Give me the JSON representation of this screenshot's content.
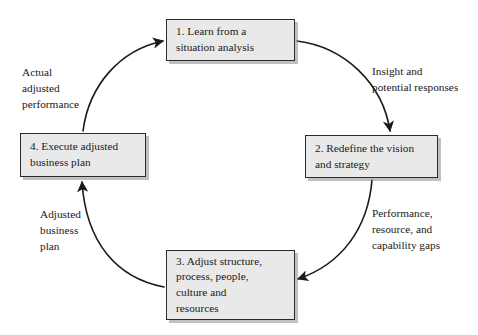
{
  "diagram": {
    "type": "cycle-flowchart",
    "title": "",
    "background_color": "#ffffff",
    "box_fill_color": "#e9e9e9",
    "box_border_color": "#2b2b2b",
    "arrow_color": "#1a1a1a",
    "nodes": [
      {
        "id": "node-1",
        "label": "1. Learn from a\nsituation analysis"
      },
      {
        "id": "node-2",
        "label": "2. Redefine the vision\nand strategy"
      },
      {
        "id": "node-3",
        "label": "3. Adjust structure,\nprocess, people,\nculture and\nresources"
      },
      {
        "id": "node-4",
        "label": "4. Execute adjusted\nbusiness plan"
      }
    ],
    "edge_labels": [
      {
        "id": "label-insight",
        "text": "Insight and\npotential responses",
        "from": "node-1",
        "to": "node-2"
      },
      {
        "id": "label-performance",
        "text": "Performance,\nresource, and\ncapability gaps",
        "from": "node-2",
        "to": "node-3"
      },
      {
        "id": "label-adjusted",
        "text": "Adjusted\nbusiness\nplan",
        "from": "node-3",
        "to": "node-4"
      },
      {
        "id": "label-actual",
        "text": "Actual\nadjusted\nperformance",
        "from": "node-4",
        "to": "node-1"
      }
    ]
  }
}
